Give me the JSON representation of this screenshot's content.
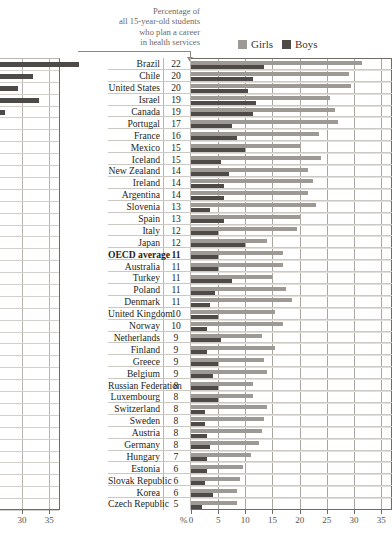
{
  "caption": {
    "lines": [
      "Percentage of",
      "all 15-year-old students",
      "who plan a career",
      "in health services"
    ]
  },
  "legend": {
    "girls_label": "Girls",
    "boys_label": "Boys",
    "girls_color": "#9d9a96",
    "boys_color": "#4d4a47"
  },
  "axis": {
    "unit": "%",
    "ticks": [
      0,
      5,
      10,
      15,
      20,
      25,
      30,
      35
    ],
    "min": 0,
    "max": 37
  },
  "left_fragment": {
    "ticks": [
      25,
      30,
      35
    ],
    "bars": [
      14.5,
      6.0,
      3.4,
      7.2,
      1.0
    ]
  },
  "chart_data": {
    "type": "bar",
    "orientation": "horizontal",
    "title": "Percentage of all 15-year-old students who plan a career in health services",
    "xlabel": "%",
    "ylabel": "",
    "xlim": [
      0,
      37
    ],
    "grid": true,
    "legend_position": "top-right",
    "categories": [
      "Brazil",
      "Chile",
      "United States",
      "Israel",
      "Canada",
      "Portugal",
      "France",
      "Mexico",
      "Iceland",
      "New Zealand",
      "Ireland",
      "Argentina",
      "Slovenia",
      "Spain",
      "Italy",
      "Japan",
      "OECD average",
      "Australia",
      "Turkey",
      "Poland",
      "Denmark",
      "United Kingdom",
      "Norway",
      "Netherlands",
      "Finland",
      "Greece",
      "Belgium",
      "Russian Federation",
      "Luxembourg",
      "Switzerland",
      "Sweden",
      "Austria",
      "Germany",
      "Hungary",
      "Estonia",
      "Slovak Republic",
      "Korea",
      "Czech Republic"
    ],
    "totals": [
      22,
      20,
      20,
      19,
      19,
      17,
      16,
      15,
      15,
      14,
      14,
      14,
      13,
      13,
      12,
      12,
      11,
      11,
      11,
      11,
      11,
      10,
      10,
      9,
      9,
      9,
      9,
      8,
      8,
      8,
      8,
      8,
      8,
      7,
      6,
      6,
      6,
      5
    ],
    "series": [
      {
        "name": "Girls",
        "color": "#9d9a96",
        "values": [
          31.5,
          29.0,
          29.5,
          25.5,
          26.5,
          27.0,
          23.5,
          20.0,
          24.0,
          21.5,
          22.5,
          21.5,
          23.0,
          20.0,
          19.5,
          14.0,
          17.0,
          17.0,
          15.0,
          17.5,
          18.5,
          15.5,
          17.0,
          13.0,
          15.5,
          13.5,
          14.0,
          11.5,
          11.5,
          14.0,
          13.5,
          13.0,
          12.5,
          11.0,
          9.5,
          9.0,
          8.5,
          8.5
        ],
        "label_note": "upper bar of each pair"
      },
      {
        "name": "Boys",
        "color": "#4d4a47",
        "values": [
          13.5,
          11.5,
          10.5,
          12.0,
          11.5,
          7.5,
          8.5,
          10.0,
          5.5,
          7.0,
          6.0,
          6.0,
          3.5,
          6.0,
          5.0,
          10.0,
          5.0,
          5.0,
          7.5,
          4.5,
          3.5,
          5.0,
          3.0,
          5.5,
          3.0,
          5.0,
          4.0,
          5.0,
          5.0,
          2.5,
          2.5,
          3.0,
          3.5,
          3.0,
          3.0,
          2.5,
          4.0,
          2.0
        ],
        "label_note": "lower bar of each pair"
      }
    ]
  }
}
